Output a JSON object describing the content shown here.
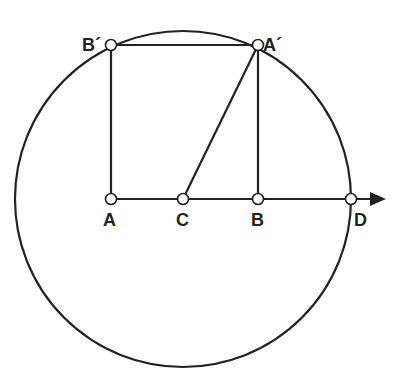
{
  "diagram": {
    "title": "",
    "circle": {
      "center": "C",
      "cx": 183,
      "cy": 199,
      "r": 168
    },
    "points": [
      {
        "id": "A",
        "label": "A",
        "x": 111,
        "y": 199,
        "lx": 103,
        "ly": 226
      },
      {
        "id": "C",
        "label": "C",
        "x": 183,
        "y": 199,
        "lx": 176,
        "ly": 226
      },
      {
        "id": "B",
        "label": "B",
        "x": 258,
        "y": 199,
        "lx": 251,
        "ly": 226
      },
      {
        "id": "D",
        "label": "D",
        "x": 351,
        "y": 199,
        "lx": 354,
        "ly": 226
      },
      {
        "id": "Ap",
        "label": "A´",
        "x": 258,
        "y": 45,
        "lx": 263,
        "ly": 51
      },
      {
        "id": "Bp",
        "label": "B´",
        "x": 111,
        "y": 45,
        "lx": 82,
        "ly": 51
      }
    ],
    "segments": [
      {
        "name": "axis-A-D",
        "from": "A",
        "to": "D"
      },
      {
        "name": "segment-A-Bp",
        "from": "A",
        "to": "Bp"
      },
      {
        "name": "segment-Bp-Ap",
        "from": "Bp",
        "to": "Ap"
      },
      {
        "name": "segment-Ap-B",
        "from": "Ap",
        "to": "B"
      },
      {
        "name": "segment-C-Ap",
        "from": "C",
        "to": "Ap"
      }
    ],
    "arrow": {
      "from_x": 351,
      "to_x": 384,
      "y": 199
    },
    "stroke_color": "#222222",
    "node_fill": "#ffffff"
  }
}
